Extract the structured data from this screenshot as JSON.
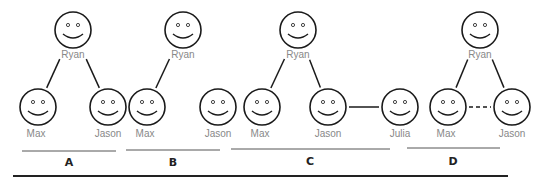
{
  "panels": [
    {
      "label": "A",
      "people": [
        "Ryan",
        "Max",
        "Jason"
      ],
      "links": [
        {
          "from": "Ryan",
          "to": "Max",
          "style": "solid"
        },
        {
          "from": "Ryan",
          "to": "Jason",
          "style": "solid"
        }
      ]
    },
    {
      "label": "B",
      "people": [
        "Ryan",
        "Max",
        "Jason"
      ],
      "links": [
        {
          "from": "Ryan",
          "to": "Max",
          "style": "solid"
        }
      ]
    },
    {
      "label": "C",
      "people": [
        "Ryan",
        "Max",
        "Jason",
        "Julia"
      ],
      "links": [
        {
          "from": "Ryan",
          "to": "Max",
          "style": "solid"
        },
        {
          "from": "Ryan",
          "to": "Jason",
          "style": "solid"
        },
        {
          "from": "Jason",
          "to": "Julia",
          "style": "solid"
        }
      ]
    },
    {
      "label": "D",
      "people": [
        "Ryan",
        "Max",
        "Jason"
      ],
      "links": [
        {
          "from": "Ryan",
          "to": "Max",
          "style": "solid"
        },
        {
          "from": "Ryan",
          "to": "Jason",
          "style": "solid"
        },
        {
          "from": "Max",
          "to": "Jason",
          "style": "dashed"
        }
      ]
    }
  ]
}
